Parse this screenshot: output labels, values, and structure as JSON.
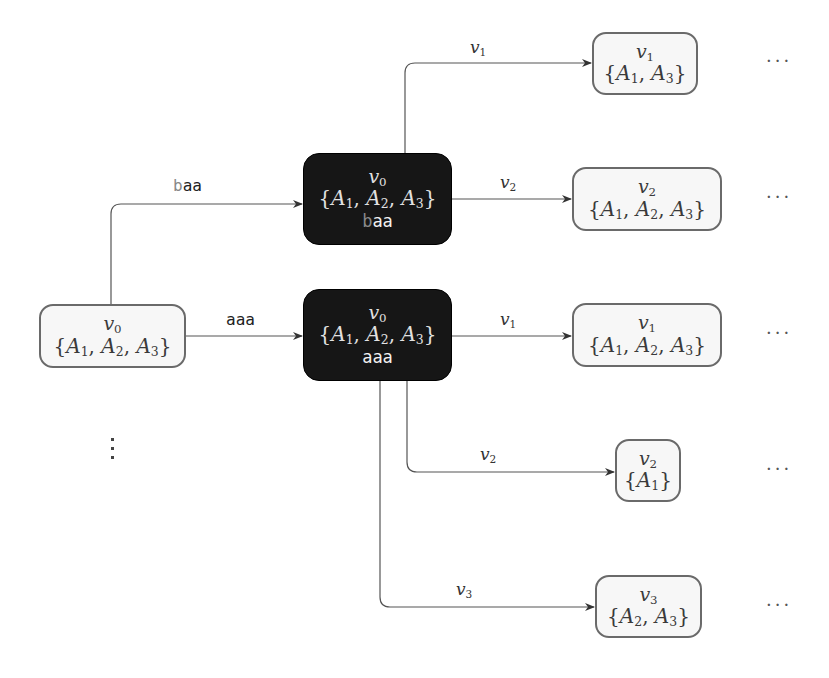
{
  "diagram": {
    "title": "",
    "colors": {
      "dark_node_bg": "#161616",
      "light_node_bg": "#f7f7f7",
      "light_node_border": "#6a6a6a",
      "edge": "#555555"
    },
    "nodes": {
      "root": {
        "var": "v0",
        "set": "{A1, A2, A3}",
        "style": "light"
      },
      "dark_baa": {
        "var": "v0",
        "set": "{A1, A2, A3}",
        "word_prefix": "b",
        "word_rest": "aa",
        "style": "dark"
      },
      "dark_aaa": {
        "var": "v0",
        "set": "{A1, A2, A3}",
        "word_prefix": "",
        "word_rest": "aaa",
        "style": "dark"
      },
      "leaf_1": {
        "var": "v1",
        "set": "{A1, A3}",
        "style": "light"
      },
      "leaf_2": {
        "var": "v2",
        "set": "{A1, A2, A3}",
        "style": "light"
      },
      "leaf_3": {
        "var": "v1",
        "set": "{A1, A2, A3}",
        "style": "light"
      },
      "leaf_4": {
        "var": "v2",
        "set": "{A1}",
        "style": "light"
      },
      "leaf_5": {
        "var": "v3",
        "set": "{A2, A3}",
        "style": "light"
      }
    },
    "edges": [
      {
        "from": "root",
        "to": "dark_baa",
        "label_prefix": "b",
        "label_rest": "aa"
      },
      {
        "from": "root",
        "to": "dark_aaa",
        "label_prefix": "",
        "label_rest": "aaa"
      },
      {
        "from": "dark_baa",
        "to": "leaf_1",
        "label": "v1"
      },
      {
        "from": "dark_baa",
        "to": "leaf_2",
        "label": "v2"
      },
      {
        "from": "dark_aaa",
        "to": "leaf_3",
        "label": "v1"
      },
      {
        "from": "dark_aaa",
        "to": "leaf_4",
        "label": "v2"
      },
      {
        "from": "dark_aaa",
        "to": "leaf_5",
        "label": "v3"
      }
    ],
    "continuation_ellipsis": "···",
    "vertical_ellipsis": "⋮"
  }
}
